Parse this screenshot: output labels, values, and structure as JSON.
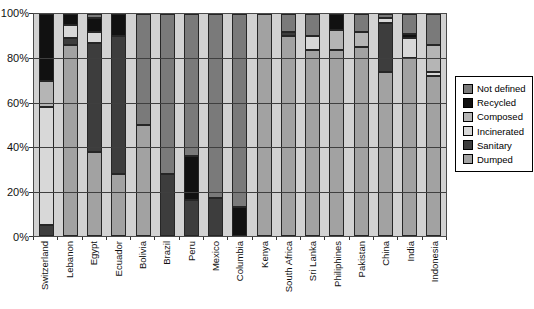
{
  "chart_data": {
    "type": "bar",
    "variant": "100%-stacked-column",
    "title": "",
    "xlabel": "",
    "ylabel": "",
    "ylim": [
      0,
      100
    ],
    "grid": "horizontal, 20% steps, drawn over bars",
    "plot_background": "#d2d2d2",
    "y_ticks": [
      "100%",
      "80%",
      "60%",
      "40%",
      "20%",
      "0%"
    ],
    "categories": [
      "Switzerland",
      "Lebanon",
      "Egypt",
      "Ecuador",
      "Bolivia",
      "Brazil",
      "Peru",
      "Mexico",
      "Columbia",
      "Kenya",
      "South Africa",
      "Sri Lanka",
      "Philiphines",
      "Pakistan",
      "China",
      "India",
      "Indonesia"
    ],
    "series": [
      {
        "name": "Dumped",
        "color": "#a2a2a2",
        "values": [
          0,
          86,
          38,
          28,
          50,
          0,
          0,
          0,
          0,
          100,
          90,
          84,
          84,
          85,
          74,
          80,
          72
        ]
      },
      {
        "name": "Sanitary",
        "color": "#3d3d3d",
        "values": [
          5,
          3,
          49,
          62,
          0,
          28,
          16,
          17,
          0,
          0,
          2,
          0,
          0,
          0,
          22,
          0,
          0
        ]
      },
      {
        "name": "Incinerated",
        "color": "#d8d8d8",
        "values": [
          53,
          6,
          5,
          0,
          0,
          0,
          0,
          0,
          0,
          0,
          0,
          6,
          0,
          0,
          2,
          9,
          2
        ]
      },
      {
        "name": "Composed",
        "color": "#b5b5b5",
        "values": [
          12,
          0,
          0,
          0,
          0,
          0,
          0,
          0,
          0,
          0,
          0,
          0,
          9,
          7,
          0,
          0,
          12
        ]
      },
      {
        "name": "Recycled",
        "color": "#111111",
        "values": [
          30,
          5,
          6,
          10,
          0,
          0,
          20,
          0,
          13,
          0,
          0,
          0,
          7,
          0,
          0,
          2,
          0
        ]
      },
      {
        "name": "Not defined",
        "color": "#7a7a7a",
        "values": [
          0,
          0,
          2,
          0,
          50,
          72,
          64,
          83,
          87,
          0,
          8,
          10,
          0,
          8,
          2,
          9,
          14
        ]
      }
    ],
    "legend_position": "right",
    "legend": [
      {
        "label": "Not defined",
        "color": "#7a7a7a"
      },
      {
        "label": "Recycled",
        "color": "#111111"
      },
      {
        "label": "Composed",
        "color": "#b5b5b5"
      },
      {
        "label": "Incinerated",
        "color": "#d8d8d8"
      },
      {
        "label": "Sanitary",
        "color": "#3d3d3d"
      },
      {
        "label": "Dumped",
        "color": "#a2a2a2"
      }
    ]
  }
}
